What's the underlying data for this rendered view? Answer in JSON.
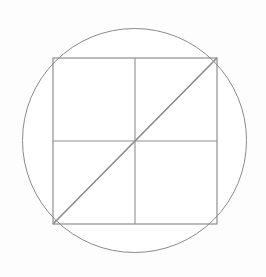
{
  "figure": {
    "background_color": "#fdfdfd",
    "stroke_color": "#8a8a8a",
    "fill_color": "#ffffff",
    "stroke_width": 1,
    "canvas": {
      "width": 266,
      "height": 277
    }
  },
  "chart_data": {
    "type": "diagram",
    "xlabel": "",
    "ylabel": "",
    "xlim": [
      0,
      266
    ],
    "ylim": [
      0,
      277
    ],
    "grid": false,
    "legend": "none",
    "shapes": [
      {
        "name": "circumscribed-circle",
        "type": "circle",
        "cx": 134.5,
        "cy": 140.5,
        "r": 112,
        "stroke": "#8a8a8a",
        "fill": "#ffffff"
      },
      {
        "name": "inscribed-square",
        "type": "rect",
        "x": 53,
        "y": 58,
        "width": 164,
        "height": 166,
        "stroke": "#858585",
        "fill": "none"
      },
      {
        "name": "vertical-midline",
        "type": "line",
        "x1": 135,
        "y1": 58,
        "x2": 135,
        "y2": 224,
        "stroke": "#8f8f8f"
      },
      {
        "name": "horizontal-midline",
        "type": "line",
        "x1": 53,
        "y1": 141,
        "x2": 217,
        "y2": 141,
        "stroke": "#8f8f8f"
      },
      {
        "name": "diagonal-tl-br",
        "type": "line",
        "x1": 53,
        "y1": 58,
        "x2": 217,
        "y2": 224,
        "stroke": "#909090"
      },
      {
        "name": "diagonal-tr-bl",
        "type": "line",
        "x1": 217,
        "y1": 58,
        "x2": 53,
        "y2": 224,
        "stroke": "#909090"
      }
    ],
    "points": [
      {
        "name": "center",
        "x": 135,
        "y": 141
      },
      {
        "name": "corner-top-left",
        "x": 53,
        "y": 58
      },
      {
        "name": "corner-top-right",
        "x": 217,
        "y": 58
      },
      {
        "name": "corner-bottom-right",
        "x": 217,
        "y": 224
      },
      {
        "name": "corner-bottom-left",
        "x": 53,
        "y": 224
      }
    ]
  }
}
